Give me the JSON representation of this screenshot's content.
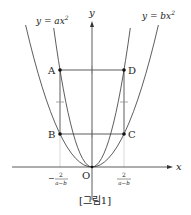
{
  "figure": {
    "caption": "[그림1]",
    "axes": {
      "x_label": "x",
      "y_label": "y",
      "origin_label": "O"
    },
    "curves": [
      {
        "name": "y=ax^2",
        "label_main": "y = ax",
        "label_exp": "2",
        "role": "inner (narrower) parabola"
      },
      {
        "name": "y=bx^2",
        "label_main": "y = bx",
        "label_exp": "2",
        "role": "outer (wider) parabola"
      }
    ],
    "points": {
      "A": "A",
      "B": "B",
      "C": "C",
      "D": "D"
    },
    "x_ticks": {
      "left": {
        "sign": "−",
        "numerator": "2",
        "denominator": "a−b"
      },
      "right": {
        "numerator": "2",
        "denominator": "a−b"
      }
    },
    "colors": {
      "line": "#333333",
      "faint": "#bbbbbb",
      "text": "#222222"
    }
  }
}
